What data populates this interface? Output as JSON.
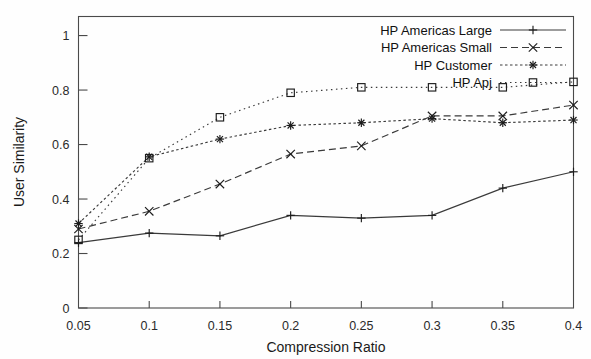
{
  "chart_data": {
    "type": "line",
    "title": "",
    "xlabel": "Compression Ratio",
    "ylabel": "User Similarity",
    "x": [
      0.05,
      0.1,
      0.15,
      0.2,
      0.25,
      0.3,
      0.35,
      0.4
    ],
    "xtick_labels": [
      "0.05",
      "0.1",
      "0.15",
      "0.2",
      "0.25",
      "0.3",
      "0.35",
      "0.4"
    ],
    "ytick_labels": [
      "0",
      "0.2",
      "0.4",
      "0.6",
      "0.8",
      "1"
    ],
    "ytick_values": [
      0,
      0.2,
      0.4,
      0.6,
      0.8,
      1
    ],
    "xlim": [
      0.05,
      0.4
    ],
    "ylim": [
      0,
      1.07
    ],
    "grid": false,
    "legend_position": "top-right",
    "series": [
      {
        "name": "HP Americas Large",
        "marker": "plus",
        "dash": "none",
        "values": [
          0.24,
          0.275,
          0.265,
          0.34,
          0.33,
          0.34,
          0.44,
          0.5
        ]
      },
      {
        "name": "HP Americas Small",
        "marker": "cross",
        "dash": "dashed",
        "values": [
          0.29,
          0.355,
          0.455,
          0.565,
          0.595,
          0.705,
          0.705,
          0.745
        ]
      },
      {
        "name": "HP Customer",
        "marker": "asterisk",
        "dash": "fine-dash",
        "values": [
          0.31,
          0.555,
          0.62,
          0.67,
          0.68,
          0.695,
          0.68,
          0.69
        ]
      },
      {
        "name": "HP Apj",
        "marker": "square",
        "dash": "dotted",
        "values": [
          0.25,
          0.55,
          0.7,
          0.79,
          0.81,
          0.81,
          0.81,
          0.83
        ]
      }
    ]
  },
  "legend": {
    "entries": [
      {
        "label": "HP Americas Large"
      },
      {
        "label": "HP Americas Small"
      },
      {
        "label": "HP Customer"
      },
      {
        "label": "HP Apj"
      }
    ]
  },
  "axes": {
    "x_label": "Compression Ratio",
    "y_label": "User Similarity"
  }
}
